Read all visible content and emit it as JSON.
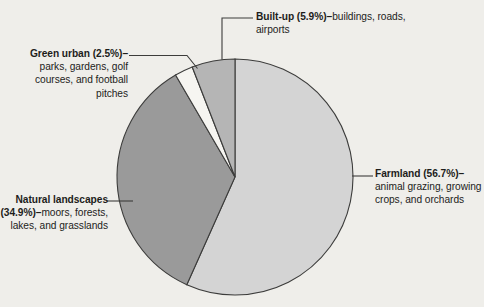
{
  "chart_data": {
    "type": "pie",
    "title": "",
    "subtitle": "",
    "xlabel": "",
    "ylabel": "",
    "legend_position": "callouts",
    "grid": false,
    "categories": [
      "Farmland",
      "Natural landscapes",
      "Green urban",
      "Built-up"
    ],
    "values": [
      56.7,
      34.9,
      2.5,
      5.9
    ],
    "units": "percent",
    "start_angle_deg": 0,
    "direction": "clockwise",
    "slices": [
      {
        "name": "Farmland",
        "value": 56.7,
        "value_label": "(56.7%)",
        "description": "animal grazing, growing crops, and orchards",
        "color": "#d4d4d4"
      },
      {
        "name": "Natural landscapes",
        "value": 34.9,
        "value_label": "(34.9%)",
        "description": "moors, forests, lakes, and grasslands",
        "color": "#9a9a9a"
      },
      {
        "name": "Green urban",
        "value": 2.5,
        "value_label": "(2.5%)",
        "description": "parks, gardens, golf courses, and football pitches",
        "color": "#f6f5f1"
      },
      {
        "name": "Built-up",
        "value": 5.9,
        "value_label": "(5.9%)",
        "description": "buildings, roads, airports",
        "color": "#b5b5b5"
      }
    ]
  },
  "callouts": {
    "builtup": {
      "head": "Built-up (5.9%)–",
      "body": "buildings, roads, airports"
    },
    "green_urban": {
      "head": "Green urban (2.5%)–",
      "body": "parks, gardens, golf courses, and football pitches"
    },
    "natural": {
      "head": "Natural landscapes (34.9%)–",
      "body": "moors, forests, lakes, and grasslands"
    },
    "farmland": {
      "head": "Farmland (56.7%)–",
      "body": "animal grazing, growing crops, and orchards"
    }
  },
  "style": {
    "background": "#efeeea",
    "outline": "#3c3c3b",
    "text": "#1d1d1b"
  }
}
